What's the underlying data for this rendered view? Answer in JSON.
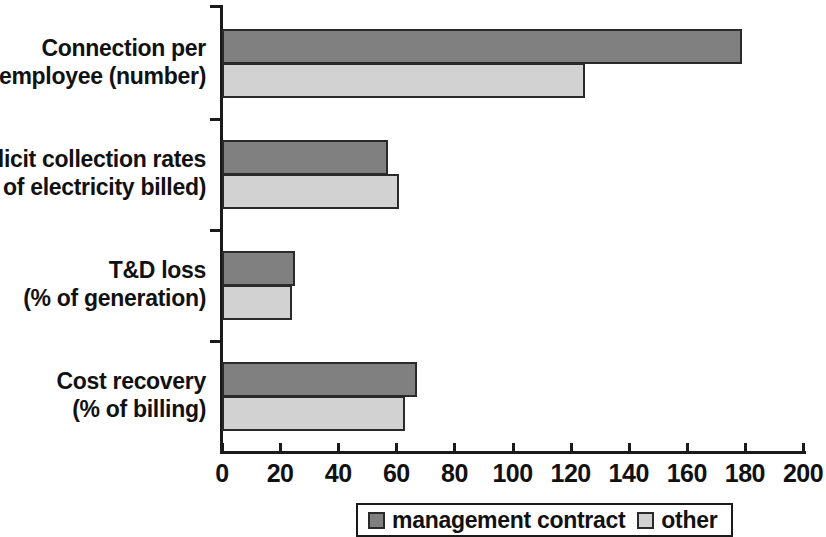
{
  "chart_data": {
    "type": "bar",
    "orientation": "horizontal",
    "title": "",
    "xlabel": "",
    "ylabel": "",
    "xlim": [
      0,
      200
    ],
    "xticks": [
      0,
      20,
      40,
      60,
      80,
      100,
      120,
      140,
      160,
      180,
      200
    ],
    "xticklabels": [
      "0",
      "20",
      "40",
      "60",
      "80",
      "100",
      "120",
      "140",
      "160",
      "180",
      "200"
    ],
    "grid": false,
    "legend_position": "bottom",
    "categories": [
      "Connection per\nemployee (number)",
      "Implicit collection rates\n(% of electricity billed)",
      "T&D loss\n(% of generation)",
      "Cost recovery\n(% of billing)"
    ],
    "series": [
      {
        "name": "management contract",
        "color": "#808080",
        "values": [
          179,
          57,
          25,
          67
        ]
      },
      {
        "name": "other",
        "color": "#d2d2d2",
        "values": [
          125,
          61,
          24,
          63
        ]
      }
    ]
  },
  "legend": {
    "entries": [
      {
        "label": "management contract"
      },
      {
        "label": "other"
      }
    ]
  }
}
